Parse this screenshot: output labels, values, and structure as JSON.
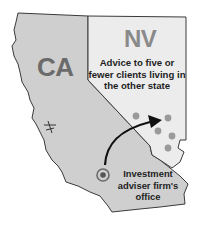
{
  "diagram": {
    "states": [
      {
        "abbr": "CA",
        "fill": "#cfcfcf"
      },
      {
        "abbr": "NV",
        "fill": "#ececec"
      }
    ],
    "nv_annotation": "Advice to five or fewer clients living in the other state",
    "office_annotation": "Investment adviser firm's office",
    "client_dot_count": 6,
    "colors": {
      "ca_fill": "#cfcfcf",
      "nv_fill": "#ececec",
      "border": "#3a3a3a",
      "dot": "#9a9a9a",
      "arrow": "#111111",
      "text": "#1e1e1e"
    }
  }
}
